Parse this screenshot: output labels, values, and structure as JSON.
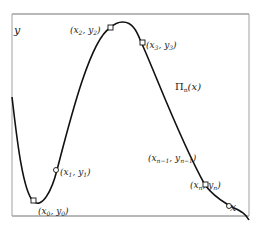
{
  "diagram": {
    "axis_labels": {
      "x": "x",
      "y": "y"
    },
    "curve_label": {
      "main": "Π",
      "sub": "n",
      "arg": "(x)"
    },
    "points": [
      {
        "id": "p0",
        "label_open": "(x",
        "sub1": "0",
        "mid": ", y",
        "sub2": "0",
        "label_close": ")"
      },
      {
        "id": "p1",
        "label_open": "(x",
        "sub1": "1",
        "mid": ", y",
        "sub2": "1",
        "label_close": ")"
      },
      {
        "id": "p2",
        "label_open": "(x",
        "sub1": "2",
        "mid": ", y",
        "sub2": "2",
        "label_close": ")"
      },
      {
        "id": "p3",
        "label_open": "(x",
        "sub1": "3",
        "mid": ", y",
        "sub2": "3",
        "label_close": ")"
      },
      {
        "id": "pn1",
        "label_open": "(x",
        "sub1": "n−1",
        "mid": ", y",
        "sub2": "n−1",
        "label_close": ")"
      },
      {
        "id": "pn",
        "label_open": "(x",
        "sub1": "n",
        "mid": ", y",
        "sub2": "n",
        "label_close": ")"
      }
    ],
    "colors": {
      "frame": "#9a9a9a",
      "curve": "#111111",
      "marker_fill": "#ffffff"
    }
  }
}
